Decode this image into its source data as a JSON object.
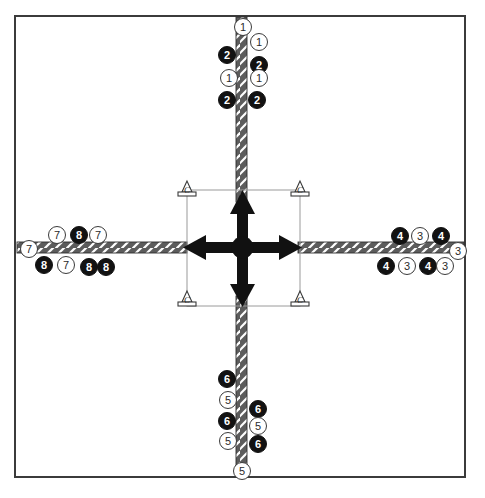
{
  "figure": {
    "title": "",
    "top_caption_fragment": "",
    "background_color": "#ffffff",
    "frame_color": "#3b3b3b",
    "road_fill": "#5c5c5c",
    "road_hatch_color": "#ffffff",
    "arrow_color": "#111111",
    "support_outline": "#3a3a3a",
    "support_link_color": "#8d8d8d"
  },
  "chart_data": {
    "type": "diagram",
    "center": {
      "label": "center-node",
      "x": 243,
      "y": 248
    },
    "legs": [
      {
        "name": "north",
        "direction": "up"
      },
      {
        "name": "south",
        "direction": "down"
      },
      {
        "name": "east",
        "direction": "right"
      },
      {
        "name": "west",
        "direction": "left"
      }
    ],
    "supports": [
      {
        "label": "C",
        "position": "top-left"
      },
      {
        "label": "C",
        "position": "top-right"
      },
      {
        "label": "C",
        "position": "bottom-left"
      },
      {
        "label": "C",
        "position": "bottom-right"
      }
    ],
    "markers": [
      {
        "id": "m01",
        "label": "1",
        "style": "white",
        "leg": "north",
        "x": 234,
        "y": 18
      },
      {
        "id": "m02",
        "label": "1",
        "style": "white",
        "leg": "north",
        "x": 250,
        "y": 33
      },
      {
        "id": "m03",
        "label": "2",
        "style": "black",
        "leg": "north",
        "x": 218,
        "y": 46
      },
      {
        "id": "m04",
        "label": "2",
        "style": "black",
        "leg": "north",
        "x": 250,
        "y": 56
      },
      {
        "id": "m05",
        "label": "1",
        "style": "white",
        "leg": "north",
        "x": 220,
        "y": 69
      },
      {
        "id": "m06",
        "label": "1",
        "style": "white",
        "leg": "north",
        "x": 250,
        "y": 69
      },
      {
        "id": "m07",
        "label": "2",
        "style": "black",
        "leg": "north",
        "x": 218,
        "y": 91
      },
      {
        "id": "m08",
        "label": "2",
        "style": "black",
        "leg": "north",
        "x": 248,
        "y": 91
      },
      {
        "id": "m09",
        "label": "6",
        "style": "black",
        "leg": "south",
        "x": 218,
        "y": 370
      },
      {
        "id": "m10",
        "label": "5",
        "style": "white",
        "leg": "south",
        "x": 219,
        "y": 391
      },
      {
        "id": "m11",
        "label": "6",
        "style": "black",
        "leg": "south",
        "x": 249,
        "y": 400
      },
      {
        "id": "m12",
        "label": "6",
        "style": "black",
        "leg": "south",
        "x": 218,
        "y": 412
      },
      {
        "id": "m13",
        "label": "5",
        "style": "white",
        "leg": "south",
        "x": 249,
        "y": 417
      },
      {
        "id": "m14",
        "label": "5",
        "style": "white",
        "leg": "south",
        "x": 219,
        "y": 432
      },
      {
        "id": "m15",
        "label": "6",
        "style": "black",
        "leg": "south",
        "x": 249,
        "y": 435
      },
      {
        "id": "m16",
        "label": "5",
        "style": "white",
        "leg": "south",
        "x": 233,
        "y": 462
      },
      {
        "id": "m17",
        "label": "7",
        "style": "white",
        "leg": "west",
        "x": 48,
        "y": 226
      },
      {
        "id": "m18",
        "label": "8",
        "style": "black",
        "leg": "west",
        "x": 70,
        "y": 226
      },
      {
        "id": "m19",
        "label": "7",
        "style": "white",
        "leg": "west",
        "x": 89,
        "y": 226
      },
      {
        "id": "m20",
        "label": "7",
        "style": "white",
        "leg": "west",
        "x": 20,
        "y": 240
      },
      {
        "id": "m21",
        "label": "8",
        "style": "black",
        "leg": "west",
        "x": 35,
        "y": 256
      },
      {
        "id": "m22",
        "label": "7",
        "style": "white",
        "leg": "west",
        "x": 57,
        "y": 256
      },
      {
        "id": "m23",
        "label": "8",
        "style": "black",
        "leg": "west",
        "x": 80,
        "y": 258
      },
      {
        "id": "m24",
        "label": "8",
        "style": "black",
        "leg": "west",
        "x": 97,
        "y": 258
      },
      {
        "id": "m25",
        "label": "4",
        "style": "black",
        "leg": "east",
        "x": 391,
        "y": 227
      },
      {
        "id": "m26",
        "label": "3",
        "style": "white",
        "leg": "east",
        "x": 411,
        "y": 227
      },
      {
        "id": "m27",
        "label": "4",
        "style": "black",
        "leg": "east",
        "x": 432,
        "y": 227
      },
      {
        "id": "m28",
        "label": "3",
        "style": "white",
        "leg": "east",
        "x": 449,
        "y": 242
      },
      {
        "id": "m29",
        "label": "4",
        "style": "black",
        "leg": "east",
        "x": 377,
        "y": 257
      },
      {
        "id": "m30",
        "label": "3",
        "style": "white",
        "leg": "east",
        "x": 398,
        "y": 257
      },
      {
        "id": "m31",
        "label": "4",
        "style": "black",
        "leg": "east",
        "x": 419,
        "y": 257
      },
      {
        "id": "m32",
        "label": "3",
        "style": "white",
        "leg": "east",
        "x": 436,
        "y": 257
      }
    ],
    "marker_groups": {
      "north": [
        "1",
        "2"
      ],
      "east": [
        "3",
        "4"
      ],
      "south": [
        "5",
        "6"
      ],
      "west": [
        "7",
        "8"
      ]
    }
  }
}
